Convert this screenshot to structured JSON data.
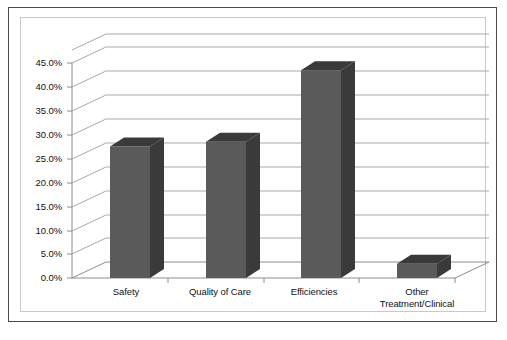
{
  "chart_data": {
    "type": "bar",
    "title": "",
    "subtitle": "",
    "xlabel": "",
    "ylabel": "",
    "categories": [
      "Safety",
      "Quality of Care",
      "Efficiencies",
      "Other Treatment/Clinical"
    ],
    "category_lines": [
      [
        "Safety"
      ],
      [
        "Quality of Care"
      ],
      [
        "Efficiencies"
      ],
      [
        "Other",
        "Treatment/Clinical"
      ]
    ],
    "values": [
      27.5,
      28.5,
      43.5,
      3.0
    ],
    "value_labels": [
      "27.5%",
      "28.5%",
      "43.5%",
      "3.0%"
    ],
    "series": [
      {
        "name": "",
        "values": [
          27.5,
          28.5,
          43.5,
          3.0
        ]
      }
    ],
    "ylim": [
      0,
      45
    ],
    "ytick_step": 5,
    "ytick_labels": [
      "45.0%",
      "40.0%",
      "35.0%",
      "30.0%",
      "25.0%",
      "20.0%",
      "15.0%",
      "10.0%",
      "5.0%",
      "0.0%"
    ],
    "ytick_values": [
      45,
      40,
      35,
      30,
      25,
      20,
      15,
      10,
      5,
      0
    ],
    "grid": true,
    "legend": false,
    "legend_position": "none",
    "three_d": true,
    "colors": {
      "bar_front": "#5a5a5a",
      "bar_top": "#3a3a3a",
      "bar_side": "#3a3a3a",
      "gridline": "#a8a8a8",
      "axis": "#8c8c8c",
      "frame_outer": "#4a4a4a",
      "frame_inner": "#c9c9c9",
      "background": "#ffffff",
      "text": "#111111"
    }
  }
}
